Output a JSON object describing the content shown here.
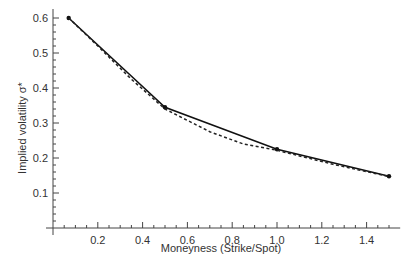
{
  "chart_data": {
    "type": "line",
    "title": "",
    "xlabel": "Moneyness (Strike/Spot)",
    "ylabel": "Implied volatility σ*",
    "xlim": [
      0,
      1.55
    ],
    "ylim": [
      0,
      0.62
    ],
    "x_ticks": [
      "0.2",
      "0.4",
      "0.6",
      "0.8",
      "1.0",
      "1.2",
      "1.4"
    ],
    "y_ticks": [
      "0.1",
      "0.2",
      "0.3",
      "0.4",
      "0.5",
      "0.6"
    ],
    "grid": false,
    "legend": null,
    "series": [
      {
        "name": "Market implied volatility (solid, markers)",
        "style": "solid",
        "x": [
          0.07,
          0.5,
          1.0,
          1.5
        ],
        "y": [
          0.6,
          0.345,
          0.225,
          0.148
        ]
      },
      {
        "name": "Fitted smile (dashed)",
        "style": "dashed",
        "x": [
          0.07,
          0.2,
          0.35,
          0.5,
          0.7,
          0.85,
          1.0,
          1.25,
          1.5
        ],
        "y": [
          0.6,
          0.52,
          0.425,
          0.34,
          0.275,
          0.24,
          0.222,
          0.182,
          0.147
        ]
      }
    ]
  }
}
